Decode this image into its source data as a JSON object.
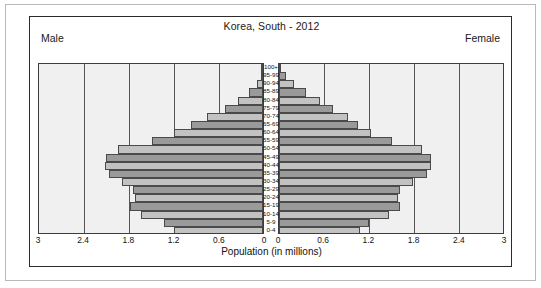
{
  "chart_data": {
    "type": "bar",
    "subtype": "population-pyramid",
    "title": "Korea, South - 2012",
    "xlabel": "Population (in millions)",
    "ylabel": "",
    "left_label": "Male",
    "right_label": "Female",
    "xlim": [
      0,
      3
    ],
    "xticks_left": [
      "3",
      "2.4",
      "1.8",
      "1.2",
      "0.6",
      "0"
    ],
    "xticks_right": [
      "0",
      "0.6",
      "1.2",
      "1.8",
      "2.4",
      "3"
    ],
    "tick_values": [
      3,
      2.4,
      1.8,
      1.2,
      0.6,
      0
    ],
    "grid": true,
    "legend": "none",
    "categories": [
      "100+",
      "95-99",
      "90-94",
      "85-89",
      "80-84",
      "75-79",
      "70-74",
      "65-69",
      "60-64",
      "55-59",
      "50-54",
      "45-49",
      "40-44",
      "35-39",
      "30-34",
      "25-29",
      "20-24",
      "15-19",
      "10-14",
      "5-9",
      "0-4"
    ],
    "series": [
      {
        "name": "Male",
        "side": "left",
        "values": [
          0.01,
          0.03,
          0.08,
          0.19,
          0.33,
          0.51,
          0.74,
          0.95,
          1.18,
          1.48,
          1.92,
          2.08,
          2.1,
          2.05,
          1.87,
          1.72,
          1.7,
          1.76,
          1.62,
          1.32,
          1.18
        ]
      },
      {
        "name": "Female",
        "side": "right",
        "values": [
          0.03,
          0.09,
          0.2,
          0.36,
          0.55,
          0.72,
          0.92,
          1.05,
          1.22,
          1.5,
          1.9,
          2.02,
          2.02,
          1.96,
          1.78,
          1.6,
          1.58,
          1.6,
          1.46,
          1.2,
          1.08
        ]
      }
    ],
    "colors": {
      "bar_light": "#c2c2c2",
      "bar_dark": "#9a9a9a",
      "bar_border": "#4a4a4a",
      "plot_background": "#f0f0f0",
      "gridline": "#555555",
      "frame": "#2b2b2b",
      "text": "#111111"
    }
  }
}
